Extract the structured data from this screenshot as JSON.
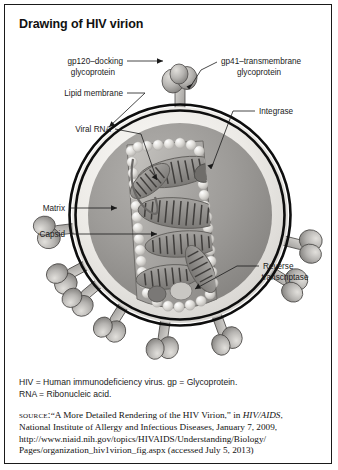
{
  "figure": {
    "title": "Drawing of HIV virion"
  },
  "labels": {
    "gp120": {
      "line1": "gp120–docking",
      "line2": "glycoprotein"
    },
    "gp41": {
      "line1": "gp41–transmembrane",
      "line2": "glycoprotein"
    },
    "lipid_membrane": "Lipid membrane",
    "integrase": "Integrase",
    "viral_rna": "Viral RNA",
    "matrix": "Matrix",
    "capsid": "Capsid",
    "reverse_transcriptase": {
      "line1": "Reverse",
      "line2": "transcriptase"
    }
  },
  "footer": {
    "abbrev_line1": "HIV = Human immunodeficiency virus. gp = Glycoprotein.",
    "abbrev_line2": "RNA = Ribonucleic acid.",
    "source_label": "source:",
    "source_part1": "“A More Detailed Rendering of the HIV Virion,” in ",
    "source_italic": "HIV/AIDS",
    "source_part2": ",",
    "source_line2": "National Institute of Allergy and Infectious Diseases, January 7, 2009,",
    "source_line3": "http://www.niaid.nih.gov/topics/HIVAIDS/Understanding/Biology/",
    "source_line4": "Pages/organization_hiv1virion_fig.aspx (accessed July 5, 2013)"
  },
  "colors": {
    "ink": "#1a1a1a",
    "membrane_outer": "#111111",
    "envelope_fill": "#f2f0ec",
    "matrix_fill": "#9c9a97",
    "capsid_fill": "#8e8c89",
    "rna_fill": "#7d7b79",
    "spike_fill": "#b5b3b0",
    "bead_fill": "#dedcd8",
    "page_bg": "#ffffff"
  }
}
